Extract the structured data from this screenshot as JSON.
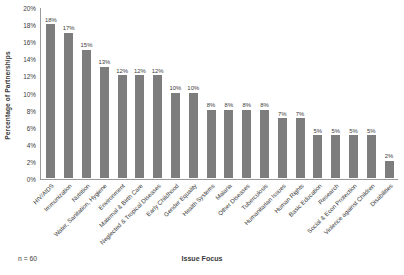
{
  "chart_data": {
    "type": "bar",
    "title": "",
    "xlabel": "Issue Focus",
    "ylabel": "Percentage of Partnerships",
    "ylim": [
      0,
      20
    ],
    "y_tick_labels": [
      "20%",
      "18%",
      "16%",
      "14%",
      "12%",
      "10%",
      "8%",
      "6%",
      "4%",
      "2%",
      "0%"
    ],
    "y_ticks": [
      20,
      18,
      16,
      14,
      12,
      10,
      8,
      6,
      4,
      2,
      0
    ],
    "grid": false,
    "legend": "none",
    "bar_color": "#7d7d7d",
    "axis_color": "#9a9a9a",
    "text_color": "#3b3b3b",
    "categories": [
      "HIV/AIDS",
      "Immunization",
      "Nutrition",
      "Water, Sanitation, Hygiene",
      "Environment",
      "Maternal & Birth Care",
      "Neglected & Tropical Diseases",
      "Early Childhood",
      "Gender Equality",
      "Health Systems",
      "Malaria",
      "Other Diseases",
      "Tuberculosis",
      "Humanitarian Issues",
      "Human Rights",
      "Basic Education",
      "Research",
      "Social & Econ Protection",
      "Violence against Children",
      "Disabilities"
    ],
    "values": [
      18,
      17,
      15,
      13,
      12,
      12,
      12,
      10,
      10,
      8,
      8,
      8,
      8,
      7,
      7,
      5,
      5,
      5,
      5,
      2
    ],
    "data_labels": [
      "18%",
      "17%",
      "15%",
      "13%",
      "12%",
      "12%",
      "12%",
      "10%",
      "10%",
      "8%",
      "8%",
      "8%",
      "8%",
      "7%",
      "7%",
      "5%",
      "5%",
      "5%",
      "5%",
      "2%"
    ]
  },
  "annotations": {
    "sample_size": "n = 60"
  }
}
